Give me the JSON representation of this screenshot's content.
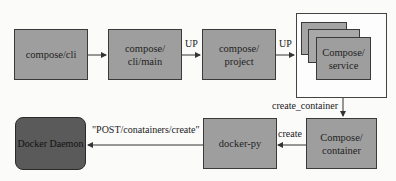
{
  "diagram": {
    "nodes": {
      "compose_cli": "compose/cli",
      "compose_cli_main_line1": "compose/",
      "compose_cli_main_line2": "cli/main",
      "compose_project_line1": "compose/",
      "compose_project_line2": "project",
      "compose_service_line1": "Compose/",
      "compose_service_line2": "service",
      "compose_container_line1": "Compose/",
      "compose_container_line2": "container",
      "docker_py": "docker-py",
      "docker_daemon": "Docker Daemon"
    },
    "edges": {
      "main_to_project": "UP",
      "project_to_service": "UP",
      "service_to_container": "create_container",
      "container_to_dockerpy": "create",
      "dockerpy_to_daemon": "\"POST/conatainers/create\""
    },
    "colors": {
      "box_fill": "#9e9e9e",
      "daemon_fill": "#5a5a5a",
      "stroke": "#3a3a3a",
      "background": "#fbfbfa"
    }
  }
}
